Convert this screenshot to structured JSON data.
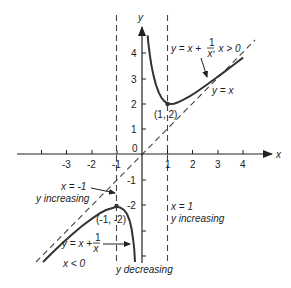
{
  "figure": {
    "axes": {
      "x_label": "x",
      "y_label": "y",
      "origin_label": "0",
      "x_ticks": [
        {
          "value": -4,
          "label": ""
        },
        {
          "value": -3,
          "label": "-3"
        },
        {
          "value": -2,
          "label": "-2"
        },
        {
          "value": -1,
          "label": "-1"
        },
        {
          "value": 1,
          "label": "1"
        },
        {
          "value": 2,
          "label": "2"
        },
        {
          "value": 3,
          "label": "3"
        },
        {
          "value": 4,
          "label": "4"
        }
      ],
      "y_ticks": [
        {
          "value": 4,
          "label": "4"
        },
        {
          "value": 3,
          "label": "3"
        },
        {
          "value": 2,
          "label": "2"
        },
        {
          "value": 1,
          "label": "1"
        },
        {
          "value": -1,
          "label": "-1"
        },
        {
          "value": -2,
          "label": "-2"
        },
        {
          "value": -3,
          "label": ""
        },
        {
          "value": -4,
          "label": ""
        }
      ]
    },
    "annotations": {
      "right_branch": {
        "prefix": "y = x + ",
        "frac_num": "1",
        "frac_den": "x",
        "suffix": ", x > 0"
      },
      "asymptote": "y = x",
      "min_point": "(1, 2)",
      "max_point": "(-1, -2)",
      "left_branch": {
        "prefix": "y = x + ",
        "frac_num": "1",
        "frac_den": "x"
      },
      "left_condition": "x < 0",
      "x_neg1_line": "x = -1",
      "x_neg1_note": "y increasing",
      "x_pos1_line": "x = 1",
      "x_pos1_note": "y increasing",
      "bottom_note": "y decreasing"
    },
    "colors": {
      "curve": "#333333",
      "axis": "#222222",
      "dashed": "#444444",
      "background": "#ffffff"
    }
  }
}
